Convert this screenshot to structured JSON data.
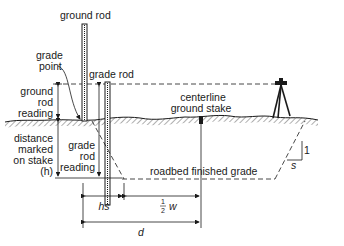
{
  "diagram": {
    "labels": {
      "ground_rod": "ground rod",
      "grade_point_1": "grade",
      "grade_point_2": "point",
      "grade_rod": "grade rod",
      "ground_rod_reading_1": "ground",
      "ground_rod_reading_2": "rod",
      "ground_rod_reading_3": "reading",
      "distance_1": "distance",
      "distance_2": "marked",
      "distance_3": "on stake",
      "distance_4": "(h)",
      "grade_rod_reading_1": "grade",
      "grade_rod_reading_2": "rod",
      "grade_rod_reading_3": "reading",
      "centerline_1": "centerline",
      "centerline_2": "ground stake",
      "roadbed": "roadbed finished grade",
      "slope_rise": "1",
      "slope_run": "s",
      "dim_hs": "hs",
      "dim_half_num": "1",
      "dim_half_den": "2",
      "dim_w": "w",
      "dim_d": "d"
    },
    "colors": {
      "ink": "#1a1a1a",
      "background": "#ffffff"
    }
  }
}
